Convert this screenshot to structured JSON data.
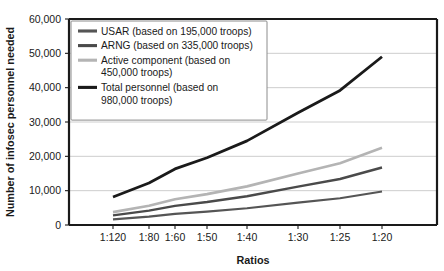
{
  "chart_data": {
    "type": "line",
    "title": "",
    "xlabel": "Ratios",
    "ylabel": "Number of infosec personnel needed",
    "x_is_categorical_uneven": true,
    "categories": [
      "1:120",
      "1:80",
      "1:60",
      "1:50",
      "1:40",
      "1:30",
      "1:25",
      "1:20"
    ],
    "x_ratio_denominators": [
      120,
      80,
      60,
      50,
      40,
      30,
      25,
      20
    ],
    "x_tick_pixels": [
      113,
      149,
      175,
      207,
      247,
      298,
      340,
      382
    ],
    "ylim": [
      0,
      60000
    ],
    "y_ticks": [
      0,
      10000,
      20000,
      30000,
      40000,
      50000,
      60000
    ],
    "y_tick_labels": [
      "0",
      "10,000",
      "20,000",
      "30,000",
      "40,000",
      "50,000",
      "60,000"
    ],
    "grid": true,
    "grid_axis": "y",
    "legend_position": "upper-left-inside",
    "series": [
      {
        "name": "USAR (based on 195,000 troops)",
        "short_name": "USAR",
        "base_troops": 195000,
        "color": "#555555",
        "width": 2.2,
        "values": [
          1625,
          2438,
          3250,
          3900,
          4875,
          6500,
          7800,
          9750
        ]
      },
      {
        "name": "ARNG (based on 335,000 troops)",
        "short_name": "ARNG",
        "base_troops": 335000,
        "color": "#4a4a4a",
        "width": 2.4,
        "values": [
          2792,
          4188,
          5583,
          6700,
          8375,
          11167,
          13400,
          16750
        ]
      },
      {
        "name": "Active component (based on 450,000 troops)",
        "short_name": "Active component",
        "base_troops": 450000,
        "color": "#b4b4b4",
        "width": 2.6,
        "values": [
          3750,
          5625,
          7500,
          9000,
          11250,
          15000,
          18000,
          22500
        ]
      },
      {
        "name": "Total personnel (based on 980,000 troops)",
        "short_name": "Total personnel",
        "base_troops": 980000,
        "color": "#1a1a1a",
        "width": 2.8,
        "values": [
          8167,
          12250,
          16333,
          19600,
          24500,
          32667,
          39200,
          49000
        ]
      }
    ]
  },
  "legend": {
    "entries": [
      {
        "lines": [
          "USAR (based on 195,000 troops)"
        ],
        "color": "#555555"
      },
      {
        "lines": [
          "ARNG (based on 335,000 troops)"
        ],
        "color": "#4a4a4a"
      },
      {
        "lines": [
          "Active component (based on",
          "450,000 troops)"
        ],
        "color": "#b4b4b4"
      },
      {
        "lines": [
          "Total personnel (based on",
          "980,000 troops)"
        ],
        "color": "#1a1a1a"
      }
    ]
  },
  "axes": {
    "x_title": "Ratios",
    "y_title": "Number of infosec personnel needed"
  },
  "colors": {
    "axis": "#1a1a1a",
    "grid": "#c8c8c8",
    "background": "#ffffff",
    "legend_border": "#8c8c8c"
  }
}
